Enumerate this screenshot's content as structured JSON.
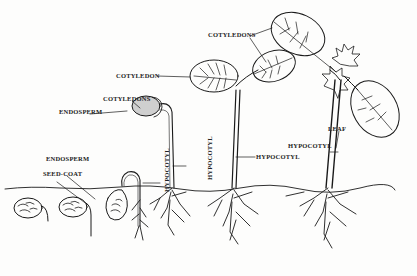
{
  "diagram": {
    "stages": 6,
    "labels": {
      "cotyledon": "COTYLEDON",
      "cotyledons_mid": "COTYLEDONS",
      "cotyledons_right": "COTYLEDONS",
      "endosperm_upper": "ENDOSPERM",
      "endosperm_lower": "ENDOSPERM",
      "seed_coat": "SEED-COAT",
      "hypocotyl_stage3": "HYPOCOTYL",
      "hypocotyl_stage4": "HYPOCOTYL",
      "hypocotyl_stage5": "HYPOCOTYL",
      "hypocotyl_stage6": "HYPOCOTYL",
      "leaf": "LEAF"
    },
    "colors": {
      "ink": "#1a1a1a",
      "paper": "#fdfdfc",
      "endosperm_fill": "#cfcfcf"
    }
  }
}
